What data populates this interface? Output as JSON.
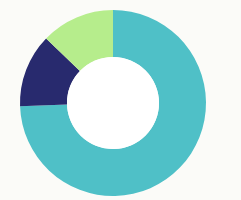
{
  "figure": {
    "name": "donut-chart",
    "background_color": "#fbfbf8",
    "center_x": 113,
    "center_y": 103,
    "outer_radius": 93,
    "inner_radius": 46,
    "hole_color": "#ffffff",
    "title": "",
    "subtitle": "",
    "caption": ""
  },
  "chart_data": {
    "type": "pie",
    "variant": "donut",
    "title": "",
    "subtitle": "",
    "xlabel": "",
    "ylabel": "",
    "legend": false,
    "legend_position": "none",
    "grid": false,
    "data_labels": false,
    "start_angle_deg": 0,
    "direction": "clockwise",
    "inner_radius_ratio": 0.495,
    "total": 100,
    "units": "percent",
    "categories": [
      "Segment 1",
      "Segment 2",
      "Segment 3"
    ],
    "values": [
      74.4,
      12.8,
      12.8
    ],
    "angles_deg": [
      268,
      46,
      46
    ],
    "colors": [
      "#4fc0c7",
      "#282a6e",
      "#b6ed8c"
    ],
    "slices": [
      {
        "name": "Segment 1",
        "value": 74.4,
        "angle_deg": 268,
        "start_deg": 0,
        "end_deg": 268,
        "color": "#4fc0c7",
        "color_name": "teal",
        "label": ""
      },
      {
        "name": "Segment 2",
        "value": 12.8,
        "angle_deg": 46,
        "start_deg": 268,
        "end_deg": 314,
        "color": "#282a6e",
        "color_name": "navy",
        "label": ""
      },
      {
        "name": "Segment 3",
        "value": 12.8,
        "angle_deg": 46,
        "start_deg": 314,
        "end_deg": 360,
        "color": "#b6ed8c",
        "color_name": "light-green",
        "label": ""
      }
    ]
  }
}
